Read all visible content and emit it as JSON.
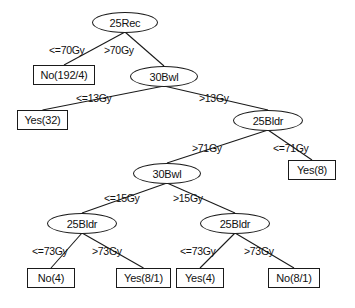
{
  "diagram": {
    "type": "decision-tree",
    "title": "",
    "nodes": [
      {
        "id": "n0",
        "label": "25Rec",
        "kind": "internal",
        "x": 92,
        "y": 12,
        "w": 66,
        "h": 21
      },
      {
        "id": "n1",
        "label": "No(192/4)",
        "kind": "leaf",
        "x": 33,
        "y": 65,
        "w": 62,
        "h": 20
      },
      {
        "id": "n2",
        "label": "30Bwl",
        "kind": "internal",
        "x": 130,
        "y": 66,
        "w": 68,
        "h": 21
      },
      {
        "id": "n3",
        "label": "Yes(32)",
        "kind": "leaf",
        "x": 17,
        "y": 110,
        "w": 51,
        "h": 20
      },
      {
        "id": "n4",
        "label": "25Bldr",
        "kind": "internal",
        "x": 233,
        "y": 110,
        "w": 70,
        "h": 21
      },
      {
        "id": "n5",
        "label": "Yes(8)",
        "kind": "leaf",
        "x": 288,
        "y": 160,
        "w": 48,
        "h": 20
      },
      {
        "id": "n6",
        "label": "30Bwl",
        "kind": "internal",
        "x": 133,
        "y": 163,
        "w": 68,
        "h": 21
      },
      {
        "id": "n7",
        "label": "25Bldr",
        "kind": "internal",
        "x": 47,
        "y": 213,
        "w": 70,
        "h": 21
      },
      {
        "id": "n8",
        "label": "25Bldr",
        "kind": "internal",
        "x": 200,
        "y": 213,
        "w": 70,
        "h": 21
      },
      {
        "id": "n9",
        "label": "No(4)",
        "kind": "leaf",
        "x": 27,
        "y": 268,
        "w": 48,
        "h": 20
      },
      {
        "id": "n10",
        "label": "Yes(8/1)",
        "kind": "leaf",
        "x": 116,
        "y": 268,
        "w": 55,
        "h": 20
      },
      {
        "id": "n11",
        "label": "Yes(4)",
        "kind": "leaf",
        "x": 176,
        "y": 268,
        "w": 48,
        "h": 20
      },
      {
        "id": "n12",
        "label": "No(8/1)",
        "kind": "leaf",
        "x": 268,
        "y": 268,
        "w": 52,
        "h": 20
      }
    ],
    "edges": [
      {
        "from": "n0",
        "to": "n1",
        "label": "<=70Gy",
        "lx": 49,
        "ly": 44
      },
      {
        "from": "n0",
        "to": "n2",
        "label": ">70Gy",
        "lx": 104,
        "ly": 44
      },
      {
        "from": "n2",
        "to": "n3",
        "label": "<=13Gy",
        "lx": 76,
        "ly": 92
      },
      {
        "from": "n2",
        "to": "n4",
        "label": ">13Gy",
        "lx": 199,
        "ly": 92
      },
      {
        "from": "n4",
        "to": "n6",
        "label": ">71Gy",
        "lx": 192,
        "ly": 142
      },
      {
        "from": "n4",
        "to": "n5",
        "label": "<=71Gy",
        "lx": 273,
        "ly": 142
      },
      {
        "from": "n6",
        "to": "n7",
        "label": "<=15Gy",
        "lx": 104,
        "ly": 192
      },
      {
        "from": "n6",
        "to": "n8",
        "label": ">15Gy",
        "lx": 173,
        "ly": 192
      },
      {
        "from": "n7",
        "to": "n9",
        "label": "<=73Gy",
        "lx": 32,
        "ly": 245
      },
      {
        "from": "n7",
        "to": "n10",
        "label": ">73Gy",
        "lx": 92,
        "ly": 245
      },
      {
        "from": "n8",
        "to": "n11",
        "label": "<=73Gy",
        "lx": 180,
        "ly": 245
      },
      {
        "from": "n8",
        "to": "n12",
        "label": ">73Gy",
        "lx": 244,
        "ly": 245
      }
    ],
    "colors": {
      "stroke": "#1a1a1a",
      "text": "#111111",
      "background": "#ffffff"
    }
  }
}
